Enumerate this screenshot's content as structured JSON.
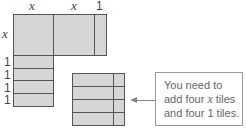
{
  "diagram": {
    "top_labels": [
      "x",
      "x",
      "1"
    ],
    "side_labels": [
      "x",
      "1",
      "1",
      "1",
      "1"
    ],
    "callout": {
      "line1": "You need to",
      "line2_pre": "add four ",
      "line2_var": "x",
      "line2_post": " tiles",
      "line3": "and four 1 tiles."
    },
    "colors": {
      "tile_fill": "#d6d6d6",
      "tile_border": "#555555",
      "callout_border": "#999999",
      "text": "#666666"
    }
  }
}
